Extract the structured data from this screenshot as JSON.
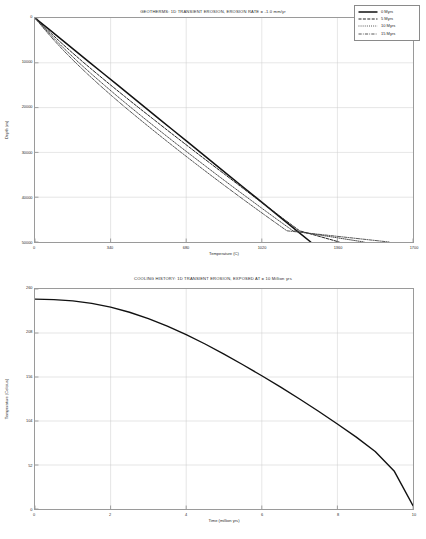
{
  "page": {
    "background": "#ffffff",
    "ink": "#1d1d1d",
    "grid_color": "#cccccc",
    "frame_color": "#9a9a9a"
  },
  "figures": [
    {
      "id": "geotherms",
      "title": "GEOTHERMS: 1D TRANSIENT EROSION, EROSION RATE = -1.0 mm/yr"
    },
    {
      "id": "cooling",
      "title": "COOLING HISTORY: 1D TRANSIENT EROSION, EXPOSED AT = 10 Million yrs"
    }
  ],
  "legend": {
    "position": "top-right",
    "entries": [
      {
        "label": "0 Myrs",
        "dash": "none",
        "color": "#111111",
        "width": 1.5
      },
      {
        "label": "5 Myrs",
        "dash": "3,1.4",
        "color": "#222222",
        "width": 1.0
      },
      {
        "label": "10 Myrs",
        "dash": "0.9,1.2",
        "color": "#333333",
        "width": 0.9
      },
      {
        "label": "15 Myrs",
        "dash": "3.2,1.2,0.8,1.2",
        "color": "#444444",
        "width": 0.9
      }
    ]
  },
  "chart_data": [
    {
      "type": "line",
      "id": "geotherms",
      "title": "GEOTHERMS: 1D TRANSIENT EROSION, EROSION RATE = -1.0 mm/yr",
      "xlabel": "Temperature (C)",
      "ylabel": "Depth (m)",
      "xlim": [
        0,
        1700
      ],
      "ylim": [
        0,
        50000
      ],
      "y_inverted": true,
      "grid": true,
      "xticks": [
        0,
        340,
        680,
        1020,
        1360,
        1700
      ],
      "xticklabels": [
        "0",
        "340",
        "680",
        "1020",
        "1360",
        "1700"
      ],
      "yticks": [
        0,
        10000,
        20000,
        30000,
        40000,
        50000
      ],
      "yticklabels": [
        "0",
        "10000",
        "20000",
        "30000",
        "40000",
        "50000"
      ],
      "legend_position": "upper right",
      "series": [
        {
          "name": "0 Myrs",
          "dash": "none",
          "color": "#111111",
          "width": 1.5,
          "x": [
            0,
            62,
            124,
            186,
            248,
            310,
            372,
            434,
            496,
            558,
            620,
            682,
            744,
            806,
            868,
            930,
            992,
            1054,
            1116,
            1178,
            1240
          ],
          "y": [
            0,
            2500,
            5000,
            7500,
            10000,
            12500,
            15000,
            17500,
            20000,
            22500,
            25000,
            27500,
            30000,
            32500,
            35000,
            37500,
            40000,
            42500,
            45000,
            47500,
            50000
          ]
        },
        {
          "name": "5 Myrs",
          "dash": "3,1.4",
          "color": "#222222",
          "width": 1.0,
          "x": [
            0,
            52,
            106,
            162,
            220,
            280,
            341,
            403,
            466,
            530,
            594,
            659,
            724,
            790,
            856,
            922,
            988,
            1055,
            1122,
            1190,
            1368
          ],
          "y": [
            0,
            2500,
            5000,
            7500,
            10000,
            12500,
            15000,
            17500,
            20000,
            22500,
            25000,
            27500,
            30000,
            32500,
            35000,
            37500,
            40000,
            42500,
            45000,
            47500,
            50000
          ]
        },
        {
          "name": "10 Myrs",
          "dash": "0.9,1.2",
          "color": "#333333",
          "width": 0.9,
          "x": [
            0,
            46,
            94,
            145,
            198,
            254,
            312,
            371,
            432,
            494,
            557,
            621,
            686,
            752,
            818,
            885,
            953,
            1021,
            1090,
            1160,
            1480
          ],
          "y": [
            0,
            2500,
            5000,
            7500,
            10000,
            12500,
            15000,
            17500,
            20000,
            22500,
            25000,
            27500,
            30000,
            32500,
            35000,
            37500,
            40000,
            42500,
            45000,
            47500,
            50000
          ]
        },
        {
          "name": "15 Myrs",
          "dash": "3.2,1.2,0.8,1.2",
          "color": "#444444",
          "width": 0.9,
          "x": [
            0,
            42,
            86,
            133,
            183,
            236,
            291,
            348,
            407,
            468,
            530,
            593,
            657,
            722,
            788,
            855,
            923,
            992,
            1062,
            1133,
            1592
          ],
          "y": [
            0,
            2500,
            5000,
            7500,
            10000,
            12500,
            15000,
            17500,
            20000,
            22500,
            25000,
            27500,
            30000,
            32500,
            35000,
            37500,
            40000,
            42500,
            45000,
            47500,
            50000
          ]
        }
      ]
    },
    {
      "type": "line",
      "id": "cooling",
      "title": "COOLING HISTORY: 1D TRANSIENT EROSION, EXPOSED AT = 10 Million yrs",
      "xlabel": "Time (million yrs)",
      "ylabel": "Temperature (Celcius)",
      "xlim": [
        0,
        10
      ],
      "ylim": [
        0,
        260
      ],
      "y_inverted": false,
      "grid": true,
      "xticks": [
        0,
        2,
        4,
        6,
        8,
        10
      ],
      "xticklabels": [
        "0",
        "2",
        "4",
        "6",
        "8",
        "10"
      ],
      "yticks": [
        0,
        52,
        104,
        156,
        208,
        260
      ],
      "yticklabels": [
        "0",
        "52",
        "104",
        "156",
        "208",
        "260"
      ],
      "legend_position": "none",
      "series": [
        {
          "name": "Cooling path",
          "dash": "none",
          "color": "#111111",
          "width": 1.4,
          "x": [
            0,
            0.5,
            1.0,
            1.5,
            2.0,
            2.5,
            3.0,
            3.5,
            4.0,
            4.5,
            5.0,
            5.5,
            6.0,
            6.5,
            7.0,
            7.5,
            8.0,
            8.5,
            9.0,
            9.5,
            10.0
          ],
          "y": [
            248,
            247.5,
            246,
            243,
            238.5,
            232.5,
            225,
            216,
            206,
            195,
            183,
            170.5,
            157.5,
            144,
            130,
            115.5,
            100.5,
            85,
            68,
            45,
            4
          ]
        }
      ]
    }
  ]
}
